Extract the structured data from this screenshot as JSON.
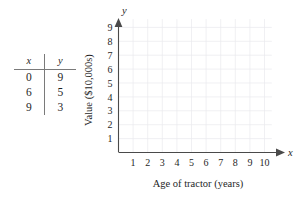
{
  "figure": {
    "table": {
      "headers": [
        "x",
        "y"
      ],
      "rows": [
        {
          "x": "0",
          "y": "9"
        },
        {
          "x": "6",
          "y": "5"
        },
        {
          "x": "9",
          "y": "3"
        }
      ]
    },
    "axis_variable_labels": {
      "x": "x",
      "y": "y"
    },
    "colors": {
      "axis": "#4a4a4a",
      "grid": "#e9e9ee",
      "text": "#1f1f1f",
      "background": "#ffffff"
    }
  },
  "chart_data": {
    "type": "scatter",
    "title": "",
    "xlabel": "Age of tractor (years)",
    "ylabel": "Value ($10,000s)",
    "xlim": [
      0,
      10.5
    ],
    "ylim": [
      0,
      9.8
    ],
    "xticks": [
      "1",
      "2",
      "3",
      "4",
      "5",
      "6",
      "7",
      "8",
      "9",
      "10"
    ],
    "yticks": [
      "1",
      "2",
      "3",
      "4",
      "5",
      "6",
      "7",
      "8",
      "9"
    ],
    "grid": true,
    "legend": "none",
    "x": [
      0,
      6,
      9
    ],
    "y": [
      9,
      5,
      3
    ],
    "plotted_points": [],
    "note": "Empty grid provided for plotting the table values; no data markers drawn."
  }
}
